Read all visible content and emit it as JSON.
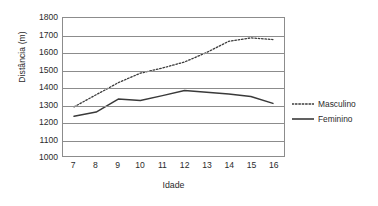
{
  "chart_data": {
    "type": "line",
    "title": "",
    "xlabel": "Idade",
    "ylabel": "Distância (m)",
    "x": [
      7,
      8,
      9,
      10,
      11,
      12,
      13,
      14,
      15,
      16
    ],
    "xtick_labels": [
      "7",
      "8",
      "9",
      "10",
      "11",
      "12",
      "13",
      "14",
      "15",
      "16"
    ],
    "ytick_labels": [
      "1800",
      "1700",
      "1600",
      "1500",
      "1400",
      "1300",
      "1200",
      "1100",
      "1000"
    ],
    "yticks": [
      1800,
      1700,
      1600,
      1500,
      1400,
      1300,
      1200,
      1100,
      1000
    ],
    "ylim": [
      1000,
      1800
    ],
    "xlim": [
      6.5,
      16.5
    ],
    "grid": "horizontal",
    "legend_position": "right",
    "series": [
      {
        "name": "Masculino",
        "style": "dotted",
        "color": "#3a3a3a",
        "values": [
          1285,
          1355,
          1425,
          1480,
          1510,
          1545,
          1600,
          1665,
          1685,
          1675
        ]
      },
      {
        "name": "Feminino",
        "style": "solid",
        "color": "#3a3a3a",
        "values": [
          1230,
          1255,
          1330,
          1322,
          1350,
          1380,
          1370,
          1360,
          1345,
          1305
        ]
      }
    ]
  },
  "axes": {
    "y_title": "Distância (m)",
    "x_title": "Idade"
  },
  "legend": {
    "items": [
      {
        "label": "Masculino"
      },
      {
        "label": "Feminino"
      }
    ]
  },
  "colors": {
    "axis": "#8c8c8c",
    "line": "#3a3a3a",
    "text": "#2b2b2b",
    "background": "#ffffff"
  }
}
